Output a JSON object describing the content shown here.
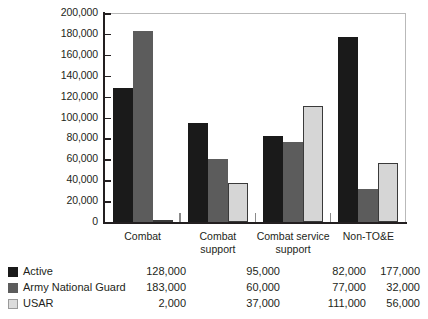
{
  "chart_data": {
    "type": "bar",
    "title": "",
    "subtitle": "",
    "xlabel": "",
    "ylabel": "",
    "ylim": [
      0,
      200000
    ],
    "ytick_labels": [
      "200,000",
      "180,000",
      "160,000",
      "140,000",
      "120,000",
      "100,000",
      "80,000",
      "60,000",
      "40,000",
      "20,000",
      "0"
    ],
    "ytick_values": [
      200000,
      180000,
      160000,
      140000,
      120000,
      100000,
      80000,
      60000,
      40000,
      20000,
      0
    ],
    "grid": false,
    "legend_position": "below-left",
    "categories": [
      "Combat",
      "Combat support",
      "Combat service support",
      "Non-TO&E"
    ],
    "category_lines": [
      [
        "Combat"
      ],
      [
        "Combat",
        "support"
      ],
      [
        "Combat service",
        "support"
      ],
      [
        "Non-TO&E"
      ]
    ],
    "series": [
      {
        "name": "Active",
        "color": "#1a1a1a",
        "values": [
          128000,
          95000,
          82000,
          177000
        ],
        "labels": [
          "128,000",
          "95,000",
          "82,000",
          "177,000"
        ]
      },
      {
        "name": "Army National Guard",
        "color": "#5c5c5c",
        "values": [
          183000,
          60000,
          77000,
          32000
        ],
        "labels": [
          "183,000",
          "60,000",
          "77,000",
          "32,000"
        ]
      },
      {
        "name": "USAR",
        "color": "#d6d6d6",
        "values": [
          2000,
          37000,
          111000,
          56000
        ],
        "labels": [
          "2,000",
          "37,000",
          "111,000",
          "56,000"
        ]
      }
    ]
  },
  "table": {
    "row_label_header": "",
    "column_headers": [
      "Combat",
      "Combat support",
      "Combat service support",
      "Non-TO&E"
    ],
    "rows": [
      {
        "series": "Active",
        "cells": [
          "128,000",
          "95,000",
          "82,000",
          "177,000"
        ]
      },
      {
        "series": "Army National Guard",
        "cells": [
          "183,000",
          "60,000",
          "77,000",
          "32,000"
        ]
      },
      {
        "series": "USAR",
        "cells": [
          "2,000",
          "37,000",
          "111,000",
          "56,000"
        ]
      }
    ]
  },
  "colors": {
    "active": "#1a1a1a",
    "army_national_guard": "#5c5c5c",
    "usar": "#d6d6d6",
    "axis": "#231f20",
    "frame": "#b9b9b9",
    "background": "#ffffff"
  }
}
